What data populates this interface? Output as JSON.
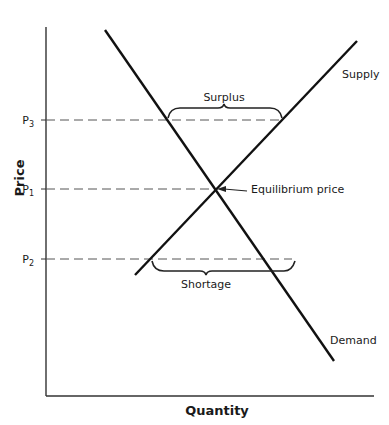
{
  "diagram": {
    "type": "supply-demand",
    "axes": {
      "x_label": "Quantity",
      "y_label": "Price"
    },
    "price_levels": [
      {
        "id": "P3",
        "base": "P",
        "sub": "3"
      },
      {
        "id": "P1",
        "base": "P",
        "sub": "1"
      },
      {
        "id": "P2",
        "base": "P",
        "sub": "2"
      }
    ],
    "curves": {
      "supply": "Supply",
      "demand": "Demand"
    },
    "annotations": {
      "surplus": "Surplus",
      "shortage": "Shortage",
      "equilibrium": "Equilibrium price"
    },
    "colors": {
      "line": "#111111",
      "dashed": "#555555",
      "text": "#1a1a1a"
    }
  }
}
